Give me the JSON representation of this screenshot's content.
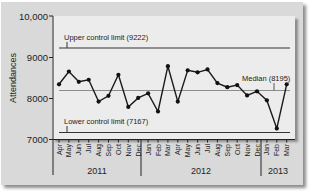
{
  "chart_data": {
    "type": "line",
    "title": "",
    "xlabel": "",
    "ylabel": "Attendances",
    "ylim": [
      7000,
      10000
    ],
    "yticks": [
      "7000",
      "8000",
      "9000",
      "10,000"
    ],
    "grid": false,
    "x": [
      "Apr",
      "May",
      "Jun",
      "Jul",
      "Aug",
      "Sep",
      "Oct",
      "Nov",
      "Dec",
      "Jan",
      "Feb",
      "Mar",
      "Apr",
      "May",
      "Jun",
      "Jul",
      "Aug",
      "Sep",
      "Oct",
      "Nov",
      "Dec",
      "Jan",
      "Feb",
      "Mar"
    ],
    "year_groups": [
      {
        "label": "2011",
        "months": 9
      },
      {
        "label": "2012",
        "months": 12
      },
      {
        "label": "2013",
        "months": 3
      }
    ],
    "series": [
      {
        "name": "Attendances",
        "values": [
          8340,
          8650,
          8400,
          8450,
          7920,
          8060,
          8570,
          7790,
          8010,
          8120,
          7680,
          8780,
          7920,
          8680,
          8630,
          8700,
          8370,
          8270,
          8320,
          8070,
          8170,
          7950,
          7270,
          8340
        ]
      }
    ],
    "reference_lines": [
      {
        "name": "Upper control limit",
        "label": "Upper control limit (9222)",
        "value": 9222
      },
      {
        "name": "Median",
        "label": "Median (8195)",
        "value": 8195
      },
      {
        "name": "Lower control limit",
        "label": "Lower control limit (7167)",
        "value": 7167
      }
    ]
  },
  "labels": {
    "ylabel": "Attendances",
    "ucl": "Upper control limit (9222)",
    "median": "Median (8195)",
    "lcl": "Lower control limit (7167)",
    "y10000": "10,000",
    "y9000": "9000",
    "y8000": "8000",
    "y7000": "7000",
    "year2011": "2011",
    "year2012": "2012",
    "year2013": "2013"
  },
  "colors": {
    "line": "#1a1a1a",
    "median": "#8c8c8c",
    "limits": "#333333",
    "frame": "#d9d9d9",
    "panel": "#ececec"
  }
}
